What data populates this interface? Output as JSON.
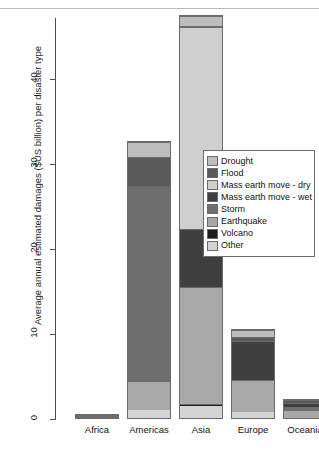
{
  "chart_data": {
    "type": "bar",
    "stacked": true,
    "title": "",
    "subtitle": "",
    "xlabel": "",
    "ylabel": "Average annual estimated damages ($US billion) per disaster type",
    "categories": [
      "Africa",
      "Americas",
      "Asia",
      "Europe",
      "Oceania"
    ],
    "ylim": [
      0,
      48
    ],
    "yticks": [
      0,
      10,
      20,
      30,
      40
    ],
    "ytick_labels": [
      "0",
      "10",
      "20",
      "30",
      "40"
    ],
    "grid": false,
    "legend_position": "center-right",
    "legend_title": "",
    "series": [
      {
        "name": "Other",
        "color": "#d4d4d4",
        "values": [
          0.0,
          0.9,
          1.4,
          0.7,
          0.0
        ]
      },
      {
        "name": "Volcano",
        "color": "#1c1c1c",
        "values": [
          0.0,
          0.0,
          0.2,
          0.0,
          0.0
        ]
      },
      {
        "name": "Earthquake",
        "color": "#a8a8a8",
        "values": [
          0.0,
          3.5,
          13.9,
          3.9,
          0.9
        ]
      },
      {
        "name": "Storm",
        "color": "#6e6e6e",
        "values": [
          0.45,
          23.1,
          0.0,
          0.0,
          0.5
        ]
      },
      {
        "name": "Mass earth move - wet",
        "color": "#3f3f3f",
        "values": [
          0.0,
          0.0,
          6.9,
          4.7,
          0.5
        ]
      },
      {
        "name": "Mass earth move - dry",
        "color": "#cfcfcf",
        "values": [
          0.0,
          0.0,
          23.8,
          0.0,
          0.0
        ]
      },
      {
        "name": "Flood",
        "color": "#5a5a5a",
        "values": [
          0.15,
          3.4,
          0.2,
          0.5,
          0.5
        ]
      },
      {
        "name": "Drought",
        "color": "#bdbdbd",
        "values": [
          0.0,
          1.8,
          1.1,
          0.8,
          0.0
        ]
      }
    ],
    "totals": [
      0.6,
      32.7,
      47.5,
      10.6,
      2.4
    ],
    "legend_entries": [
      {
        "label": "Drought",
        "color": "#bdbdbd"
      },
      {
        "label": "Flood",
        "color": "#5a5a5a"
      },
      {
        "label": "Mass earth move - dry",
        "color": "#cfcfcf"
      },
      {
        "label": "Mass earth move - wet",
        "color": "#3f3f3f"
      },
      {
        "label": "Storm",
        "color": "#6e6e6e"
      },
      {
        "label": "Earthquake",
        "color": "#a8a8a8"
      },
      {
        "label": "Volcano",
        "color": "#1c1c1c"
      },
      {
        "label": "Other",
        "color": "#d4d4d4"
      }
    ]
  }
}
